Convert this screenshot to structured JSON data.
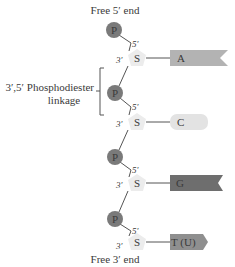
{
  "diagram": {
    "top_label": "Free 5′ end",
    "bottom_label": "Free 3′ end",
    "linkage_label_line1": "3′,5′ Phosphodiester",
    "linkage_label_line2": "linkage",
    "phosphate_symbol": "P",
    "sugar_symbol": "S",
    "prime5": "5′",
    "prime3": "3′",
    "bases": [
      {
        "label": "A",
        "shape": "flag",
        "color": "#b3b3b3"
      },
      {
        "label": "C",
        "shape": "pill",
        "color": "#e3e3e3"
      },
      {
        "label": "G",
        "shape": "flag",
        "color": "#6e6e6e"
      },
      {
        "label": "T (U)",
        "shape": "arrow",
        "color": "#8f8f8f"
      }
    ],
    "colors": {
      "phosphate": "#7a7a7a",
      "sugar": "#ececec",
      "line": "#555555"
    }
  }
}
